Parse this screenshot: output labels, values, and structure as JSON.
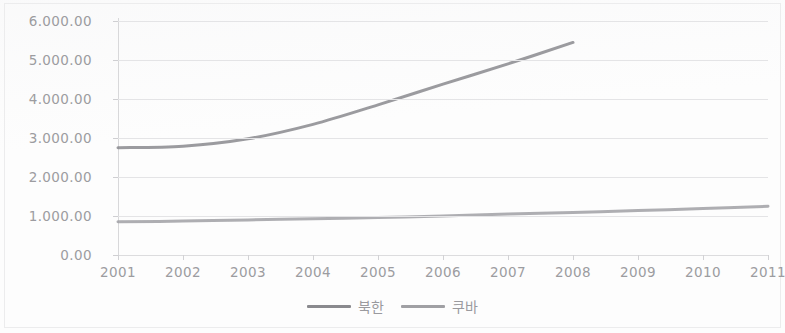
{
  "chart_data": {
    "type": "line",
    "title": "",
    "subtitle": "",
    "xlabel": "",
    "ylabel": "",
    "x": [
      2001,
      2002,
      2003,
      2004,
      2005,
      2006,
      2007,
      2008,
      2009,
      2010,
      2011
    ],
    "x_tick_labels": [
      "2001",
      "2002",
      "2003",
      "2004",
      "2005",
      "2006",
      "2007",
      "2008",
      "2009",
      "2010",
      "2011"
    ],
    "y_tick_labels": [
      "0.00",
      "1.000.00",
      "2.000.00",
      "3.000.00",
      "4.000.00",
      "5.000.00",
      "6.000.00"
    ],
    "y_tick_values": [
      0,
      1000,
      2000,
      3000,
      4000,
      5000,
      6000
    ],
    "ylim": [
      0,
      6000
    ],
    "xlim": [
      2001,
      2011
    ],
    "grid": true,
    "legend_position": "bottom-center",
    "series": [
      {
        "name": "북한",
        "color": "#8a8a8e",
        "values": [
          2750,
          2790,
          2980,
          3350,
          3850,
          4380,
          4900,
          5450,
          null,
          null,
          null
        ]
      },
      {
        "name": "쿠바",
        "color": "#a0a0a4",
        "values": [
          850,
          870,
          900,
          930,
          960,
          1000,
          1050,
          1090,
          1140,
          1190,
          1250
        ]
      }
    ]
  },
  "legend": {
    "items": [
      {
        "label": "북한"
      },
      {
        "label": "쿠바"
      }
    ]
  }
}
